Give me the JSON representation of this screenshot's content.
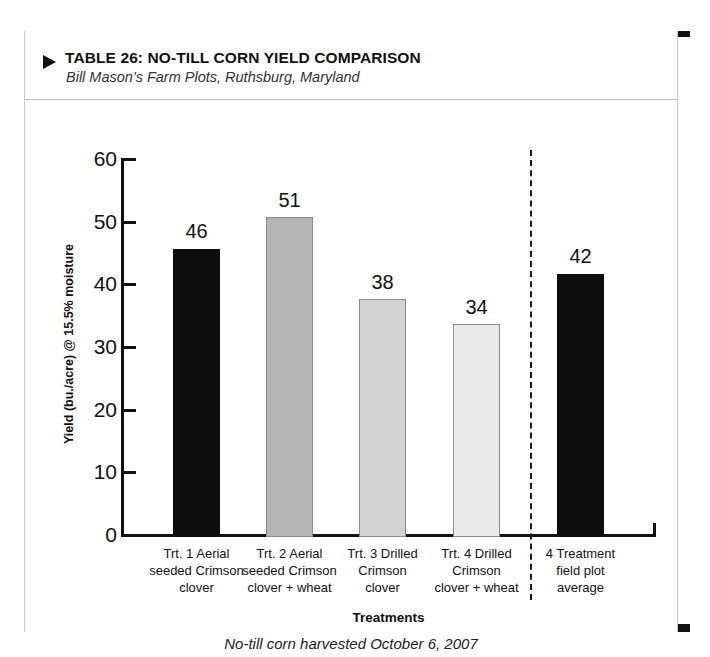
{
  "header": {
    "marker_icon": "triangle-right-icon",
    "title": "TABLE 26: NO-TILL CORN YIELD COMPARISON",
    "subtitle": "Bill Mason's Farm Plots, Ruthsburg, Maryland"
  },
  "chart_data": {
    "type": "bar",
    "title": "TABLE 26: NO-TILL CORN YIELD COMPARISON",
    "subtitle": "Bill Mason's Farm Plots, Ruthsburg, Maryland",
    "caption": "No-till corn harvested October 6, 2007",
    "xlabel": "Treatments",
    "ylabel": "Yield (bu./acre) @ 15.5% moisture",
    "ylim": [
      0,
      60
    ],
    "yticks": [
      "0",
      "10",
      "20",
      "30",
      "40",
      "50",
      "60"
    ],
    "grid": false,
    "legend": "none",
    "categories": [
      "Trt. 1 Aerial seeded Crimson clover",
      "Trt. 2 Aerial seeded Crimson clover + wheat",
      "Trt. 3 Drilled Crimson clover",
      "Trt. 4 Drilled Crimson clover + wheat",
      "4 Treatment field plot average"
    ],
    "values": [
      46,
      51,
      38,
      34,
      42
    ],
    "value_labels": [
      "46",
      "51",
      "38",
      "34",
      "42"
    ],
    "bar_colors": [
      "#0d0d0d",
      "#b4b4b4",
      "#d2d2d2",
      "#e9e9e9",
      "#0d0d0d"
    ],
    "divider_after_index": 3,
    "divider_style": "dashed"
  },
  "bars": [
    {
      "label_lines": [
        "Trt. 1 Aerial",
        "seeded Crimson",
        "clover"
      ],
      "value": "46",
      "color": "#0d0d0d"
    },
    {
      "label_lines": [
        "Trt. 2 Aerial",
        "seeded Crimson",
        "clover + wheat"
      ],
      "value": "51",
      "color": "#b4b4b4"
    },
    {
      "label_lines": [
        "Trt. 3 Drilled",
        "Crimson",
        "clover"
      ],
      "value": "38",
      "color": "#d2d2d2"
    },
    {
      "label_lines": [
        "Trt. 4 Drilled",
        "Crimson",
        "clover + wheat"
      ],
      "value": "34",
      "color": "#e9e9e9"
    },
    {
      "label_lines": [
        "4 Treatment",
        "field plot",
        "average"
      ],
      "value": "42",
      "color": "#0d0d0d"
    }
  ],
  "axis": {
    "y_title": "Yield (bu./acre) @ 15.5% moisture",
    "x_title": "Treatments",
    "ticks": [
      "60",
      "50",
      "40",
      "30",
      "20",
      "10",
      "0"
    ]
  },
  "footer": {
    "caption": "No-till corn harvested October 6, 2007"
  }
}
